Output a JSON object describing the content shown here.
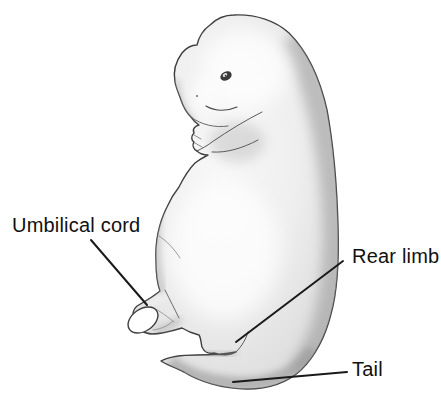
{
  "figure": {
    "illustration": "embryo-side-view",
    "labels": [
      {
        "id": "umbilical-cord",
        "text": "Umbilical cord",
        "points_to": "umbilical-cord-stub"
      },
      {
        "id": "rear-limb",
        "text": "Rear limb",
        "points_to": "rear-limb-bud"
      },
      {
        "id": "tail",
        "text": "Tail",
        "points_to": "tail"
      }
    ],
    "colors": {
      "background": "#ffffff",
      "outline": "#3f3f3f",
      "body_light": "#f7f7f7",
      "body_mid": "#e7e7e7",
      "body_shade": "#c4c4c4",
      "cord_cut_face": "#ffffff",
      "leader_line": "#1a1a1a",
      "label_text": "#111111"
    }
  }
}
